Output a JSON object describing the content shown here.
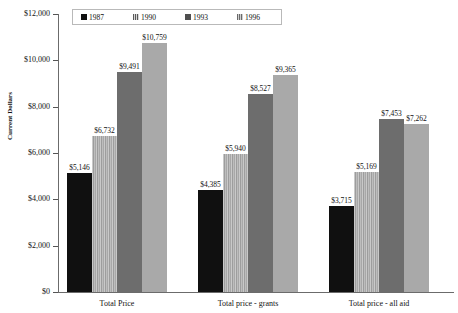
{
  "chart_data": {
    "type": "bar",
    "title": "",
    "xlabel": "",
    "ylabel": "Current Dollars",
    "ylim": [
      0,
      12000
    ],
    "ytick_step": 2000,
    "ytick_labels": [
      "$12,000",
      "$10,000",
      "$8,000",
      "$6,000",
      "$4,000",
      "$2,000",
      "$0"
    ],
    "ytick_values": [
      12000,
      10000,
      8000,
      6000,
      4000,
      2000,
      0
    ],
    "grid": false,
    "legend_position": "top-center",
    "categories": [
      "Total Price",
      "Total price - grants",
      "Total price - all aid"
    ],
    "series": [
      {
        "name": "1987",
        "color": "#101010",
        "pattern": "solid-black",
        "values": [
          5146,
          4385,
          3715
        ],
        "labels": [
          "$5,146",
          "$4,385",
          "$3,715"
        ]
      },
      {
        "name": "1990",
        "color": "#b4b4b4",
        "pattern": "vertical-stripes",
        "values": [
          6732,
          5940,
          5169
        ],
        "labels": [
          "$6,732",
          "$5,940",
          "$5,169"
        ]
      },
      {
        "name": "1993",
        "color": "#6d6d6d",
        "pattern": "solid-dark-gray",
        "values": [
          9491,
          8527,
          7453
        ],
        "labels": [
          "$9,491",
          "$8,527",
          "$7,453"
        ]
      },
      {
        "name": "1996",
        "color": "#a9a9a9",
        "pattern": "solid-light-gray",
        "values": [
          10759,
          9365,
          7262
        ],
        "labels": [
          "$10,759",
          "$9,365",
          "$7,262"
        ]
      }
    ]
  },
  "legend": {
    "items": [
      {
        "label": "1987",
        "swatch": "legend-swatch-1987"
      },
      {
        "label": "1990",
        "swatch": "legend-swatch-1990"
      },
      {
        "label": "1993",
        "swatch": "legend-swatch-1993"
      },
      {
        "label": "1996",
        "swatch": "legend-swatch-1996"
      }
    ]
  }
}
